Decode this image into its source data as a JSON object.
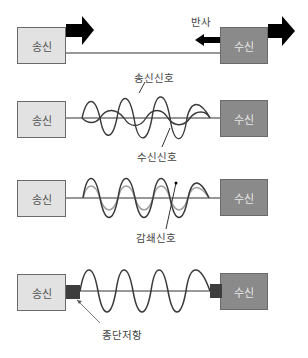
{
  "panels": [
    {
      "id": "reflection",
      "sender_label": "송신",
      "receiver_label": "수신",
      "annotation": "반사"
    },
    {
      "id": "interference",
      "sender_label": "송신",
      "receiver_label": "수신",
      "annotations": [
        "송신신호",
        "수신신호"
      ]
    },
    {
      "id": "attenuation",
      "sender_label": "송신",
      "receiver_label": "수신",
      "annotation": "감쇄신호"
    },
    {
      "id": "termination",
      "sender_label": "송신",
      "receiver_label": "수신",
      "annotation": "종단저항"
    }
  ],
  "colors": {
    "sender_fill": "#e2e2e2",
    "receiver_fill": "#8a8a8a",
    "line": "#333333",
    "wave": "#3a3a3a",
    "attenuated_wave": "#a0a0a0",
    "terminator": "#3d3d3d",
    "arrow": "#000000"
  }
}
